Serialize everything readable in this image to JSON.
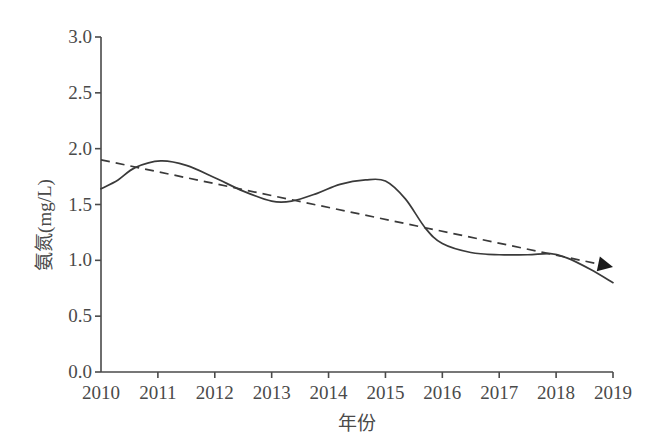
{
  "chart_data": {
    "type": "line",
    "title": "",
    "xlabel": "年份",
    "ylabel": "氨氮(mg/L)",
    "xlim": [
      2010,
      2019
    ],
    "ylim": [
      0.0,
      3.0
    ],
    "grid": false,
    "legend": "none",
    "x_tick_labels": [
      "2010",
      "2011",
      "2012",
      "2013",
      "2014",
      "2015",
      "2016",
      "2017",
      "2018",
      "2019"
    ],
    "y_tick_labels": [
      "0.0",
      "0.5",
      "1.0",
      "1.5",
      "2.0",
      "2.5",
      "3.0"
    ],
    "y_tick_values": [
      0.0,
      0.5,
      1.0,
      1.5,
      2.0,
      2.5,
      3.0
    ],
    "series": [
      {
        "name": "氨氮实测曲线",
        "style": "solid",
        "color": "#3a3a3a",
        "x": [
          2010.0,
          2010.3,
          2010.6,
          2011.05,
          2011.5,
          2012.0,
          2012.5,
          2013.0,
          2013.35,
          2013.8,
          2014.2,
          2014.65,
          2015.0,
          2015.35,
          2015.7,
          2016.0,
          2016.5,
          2017.0,
          2017.5,
          2017.9,
          2018.2,
          2018.6,
          2019.0
        ],
        "y": [
          1.64,
          1.72,
          1.83,
          1.89,
          1.85,
          1.74,
          1.62,
          1.53,
          1.53,
          1.6,
          1.68,
          1.72,
          1.71,
          1.55,
          1.29,
          1.15,
          1.07,
          1.05,
          1.05,
          1.06,
          1.02,
          0.92,
          0.8
        ]
      },
      {
        "name": "线性趋势线",
        "style": "dashed",
        "color": "#3a3a3a",
        "arrow_end": true,
        "x": [
          2010,
          2019
        ],
        "y": [
          1.9,
          0.94
        ]
      }
    ]
  },
  "axes": {
    "left_px": 101,
    "right_px": 613,
    "top_px": 37,
    "bottom_px": 372
  }
}
